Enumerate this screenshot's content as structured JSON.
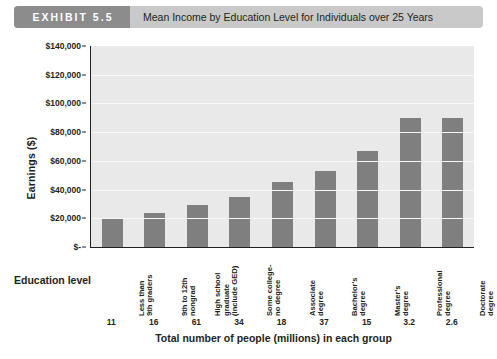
{
  "header": {
    "badge_label": "EXHIBIT 5.5",
    "title": "Mean Income by Education Level for Individuals over 25 Years"
  },
  "labels": {
    "education_level": "Education level"
  },
  "colors": {
    "bar": "#7f7f7f",
    "plot_background": "#e9e9e9",
    "badge_background": "#8c8c8c",
    "banner_background": "#c9c9c9",
    "axis": "#231f20",
    "gridline": "#f7f7f7"
  },
  "chart_data": {
    "type": "bar",
    "title": "Mean Income by Education Level for Individuals over 25 Years",
    "xlabel": "Total number of people (millions) in each group",
    "ylabel": "Earnings ($)",
    "ylim": [
      0,
      140000
    ],
    "ytick_values": [
      140000,
      120000,
      100000,
      80000,
      60000,
      40000,
      20000,
      0
    ],
    "ytick_labels": [
      "$140,000",
      "$120,000",
      "$100,000",
      "$80,000",
      "$60,000",
      "$40,000",
      "$20,000",
      "$-"
    ],
    "grid": true,
    "legend": "none",
    "categories": [
      "Less than\n9th graders",
      "9th to 12th\nnongrad",
      "High school\ngraduate\n(include GED)",
      "Some college-\nno degree",
      "Associate\ndegree",
      "Bachelor's\ndegree",
      "Master's\ndegree",
      "Professional\ndegree",
      "Doctorate\ndegree"
    ],
    "values": [
      20000,
      24000,
      29000,
      35000,
      45000,
      53000,
      67000,
      90000,
      90000
    ],
    "group_counts": [
      "11",
      "16",
      "61",
      "34",
      "18",
      "37",
      "15",
      "3.2",
      "2.6"
    ],
    "group_counts_label": "Total number of people (millions) in each group"
  }
}
